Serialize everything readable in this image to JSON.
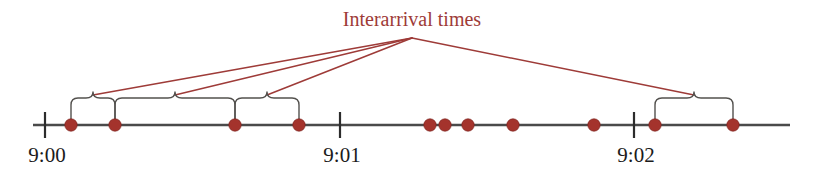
{
  "figure": {
    "title": "Interarrival times",
    "title_color": "#9e3b38",
    "dot_color": "#a4332c",
    "axis_color": "#4a4a4a",
    "brace_color": "#53514e",
    "label_color": "#1b1b1b",
    "background": "#ffffff",
    "axis": {
      "x_start": 33,
      "x_end": 790,
      "y": 125,
      "label_name": "timeline-axis"
    },
    "ticks": [
      {
        "label": "9:00",
        "x": 45
      },
      {
        "label": "9:01",
        "x": 340
      },
      {
        "label": "9:02",
        "x": 634
      }
    ],
    "dots": [
      {
        "x": 71
      },
      {
        "x": 115
      },
      {
        "x": 235
      },
      {
        "x": 299
      },
      {
        "x": 430
      },
      {
        "x": 445
      },
      {
        "x": 468
      },
      {
        "x": 513
      },
      {
        "x": 594
      },
      {
        "x": 655
      },
      {
        "x": 733
      }
    ],
    "braces": [
      {
        "x_left": 71,
        "x_right": 115,
        "peak_x": 93
      },
      {
        "x_left": 115,
        "x_right": 235,
        "peak_x": 175
      },
      {
        "x_left": 235,
        "x_right": 299,
        "peak_x": 267
      },
      {
        "x_left": 655,
        "x_right": 733,
        "peak_x": 694
      }
    ],
    "leader_lines": [
      {
        "from_x": 412,
        "from_y": 38,
        "to_x": 93,
        "to_y": 95
      },
      {
        "from_x": 412,
        "from_y": 38,
        "to_x": 175,
        "to_y": 95
      },
      {
        "from_x": 412,
        "from_y": 38,
        "to_x": 267,
        "to_y": 95
      },
      {
        "from_x": 412,
        "from_y": 38,
        "to_x": 694,
        "to_y": 95
      }
    ],
    "title_position": {
      "x": 412,
      "y": 26
    },
    "dot_radius": 6.2,
    "tick_half_height": 13,
    "tick_label_dy": 37
  },
  "chart_data": {
    "type": "scatter",
    "title": "Interarrival times",
    "xlabel": "",
    "ylabel": "",
    "axis_tick_labels": [
      "9:00",
      "9:01",
      "9:02"
    ],
    "annotations": [
      "Interarrival times"
    ],
    "x": [
      71,
      115,
      235,
      299,
      430,
      445,
      468,
      513,
      594,
      655,
      733
    ],
    "values": [
      1,
      1,
      1,
      1,
      1,
      1,
      1,
      1,
      1,
      1,
      1
    ],
    "legend_position": "none",
    "grid": false
  }
}
